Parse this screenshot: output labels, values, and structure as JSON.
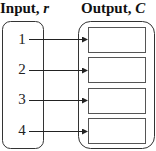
{
  "titles": {
    "input_prefix": "Input, ",
    "input_var": "r",
    "output_prefix": "Output, ",
    "output_var": "C"
  },
  "inputs": [
    "1",
    "2",
    "3",
    "4"
  ],
  "outputs": [
    "",
    "",
    "",
    ""
  ],
  "colors": {
    "stroke": "#333333",
    "text": "#111111",
    "background": "#ffffff"
  }
}
